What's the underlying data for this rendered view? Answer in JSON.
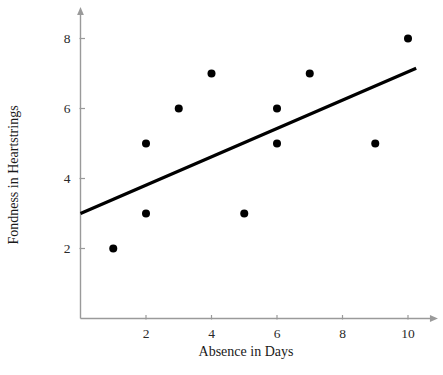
{
  "chart_data": {
    "type": "scatter",
    "title": "",
    "xlabel": "Absence in Days",
    "ylabel": "Fondness in Heartstrings",
    "xlim": [
      0,
      10.7
    ],
    "ylim": [
      0,
      8.7
    ],
    "xticks": [
      2,
      4,
      6,
      8,
      10
    ],
    "xtick_labels": [
      "2",
      "4",
      "6",
      "8",
      "10"
    ],
    "yticks": [
      2,
      4,
      6,
      8
    ],
    "ytick_labels": [
      "2",
      "4",
      "6",
      "8"
    ],
    "grid": false,
    "legend": false,
    "points": [
      {
        "x": 1,
        "y": 2
      },
      {
        "x": 2,
        "y": 3
      },
      {
        "x": 2,
        "y": 5
      },
      {
        "x": 3,
        "y": 6
      },
      {
        "x": 4,
        "y": 7
      },
      {
        "x": 5,
        "y": 3
      },
      {
        "x": 6,
        "y": 5
      },
      {
        "x": 6,
        "y": 6
      },
      {
        "x": 7,
        "y": 7
      },
      {
        "x": 9,
        "y": 5
      },
      {
        "x": 10,
        "y": 8
      }
    ],
    "marker": {
      "shape": "circle",
      "color": "#000000",
      "radius_px": 4
    },
    "trendline": {
      "kind": "linear",
      "x_start": 0,
      "y_start": 3.0,
      "x_end": 10.25,
      "y_end": 7.15,
      "color": "#000000",
      "width_px": 3.2
    },
    "axis_style": {
      "color": "#9a9a9a",
      "arrow_heads": true,
      "tick_color": "#9a9a9a"
    }
  }
}
